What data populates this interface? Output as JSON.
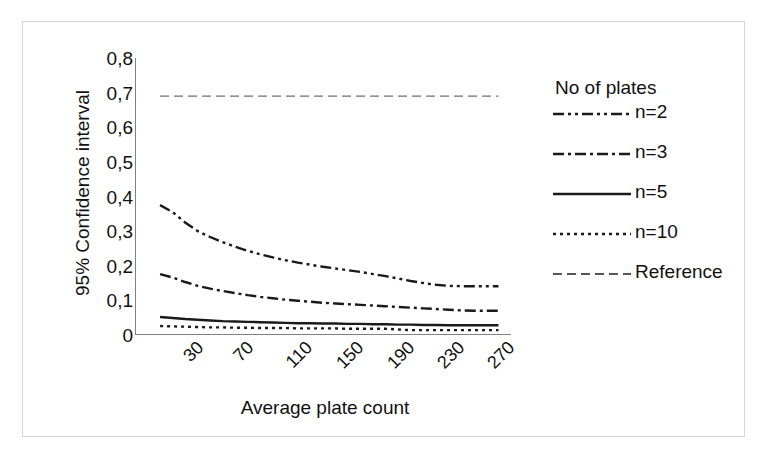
{
  "chart_data": {
    "type": "line",
    "title": "",
    "xlabel": "Average plate count",
    "ylabel": "95% Confidence interval",
    "xlim": [
      10,
      310
    ],
    "ylim": [
      0,
      0.8
    ],
    "grid": false,
    "legend_position": "right",
    "legend_title": "No of plates",
    "x_tick_labels": [
      "30",
      "70",
      "110",
      "150",
      "190",
      "230",
      "270"
    ],
    "x_tick_values": [
      30,
      70,
      110,
      150,
      190,
      230,
      270
    ],
    "y_tick_labels": [
      "0",
      "0,1",
      "0,2",
      "0,3",
      "0,4",
      "0,5",
      "0,6",
      "0,7",
      "0,8"
    ],
    "y_tick_values": [
      0,
      0.1,
      0.2,
      0.3,
      0.4,
      0.5,
      0.6,
      0.7,
      0.8
    ],
    "x": [
      30,
      40,
      50,
      60,
      70,
      80,
      90,
      100,
      110,
      120,
      130,
      140,
      150,
      160,
      170,
      180,
      190,
      200,
      210,
      220,
      230,
      240,
      250,
      260,
      270,
      280,
      290,
      300
    ],
    "series": [
      {
        "name": "n=2",
        "dash": "dash-dot-dot",
        "values": [
          0.375,
          0.355,
          0.325,
          0.3,
          0.283,
          0.268,
          0.255,
          0.243,
          0.233,
          0.224,
          0.216,
          0.209,
          0.203,
          0.197,
          0.192,
          0.187,
          0.182,
          0.176,
          0.17,
          0.163,
          0.156,
          0.15,
          0.145,
          0.142,
          0.141,
          0.141,
          0.141,
          0.141
        ]
      },
      {
        "name": "n=3",
        "dash": "dash-dot",
        "values": [
          0.176,
          0.166,
          0.153,
          0.142,
          0.134,
          0.127,
          0.121,
          0.115,
          0.11,
          0.106,
          0.102,
          0.099,
          0.096,
          0.093,
          0.091,
          0.089,
          0.087,
          0.085,
          0.083,
          0.081,
          0.079,
          0.077,
          0.075,
          0.073,
          0.071,
          0.07,
          0.07,
          0.07
        ]
      },
      {
        "name": "n=5",
        "dash": "solid",
        "values": [
          0.052,
          0.049,
          0.046,
          0.044,
          0.042,
          0.04,
          0.039,
          0.038,
          0.037,
          0.036,
          0.035,
          0.034,
          0.034,
          0.033,
          0.033,
          0.032,
          0.032,
          0.031,
          0.031,
          0.03,
          0.03,
          0.029,
          0.029,
          0.028,
          0.028,
          0.028,
          0.028,
          0.028
        ]
      },
      {
        "name": "n=10",
        "dash": "dotted",
        "values": [
          0.026,
          0.025,
          0.024,
          0.023,
          0.022,
          0.022,
          0.021,
          0.021,
          0.02,
          0.02,
          0.02,
          0.019,
          0.019,
          0.019,
          0.019,
          0.018,
          0.018,
          0.018,
          0.018,
          0.016,
          0.014,
          0.014,
          0.014,
          0.014,
          0.014,
          0.014,
          0.014,
          0.014
        ]
      },
      {
        "name": "Reference",
        "dash": "dashed",
        "constant": 0.69,
        "values": [
          0.69,
          0.69,
          0.69,
          0.69,
          0.69,
          0.69,
          0.69,
          0.69,
          0.69,
          0.69,
          0.69,
          0.69,
          0.69,
          0.69,
          0.69,
          0.69,
          0.69,
          0.69,
          0.69,
          0.69,
          0.69,
          0.69,
          0.69,
          0.69,
          0.69,
          0.69,
          0.69,
          0.69
        ]
      }
    ],
    "colors": {
      "line": "#1a1a1a",
      "reference_line": "#6f6f6f",
      "axis": "#808080",
      "frame": "#d6d6d6",
      "background": "#ffffff"
    }
  },
  "legend": {
    "title": "No of plates",
    "entries": [
      {
        "label": "n=2",
        "dash": "dash-dot-dot"
      },
      {
        "label": "n=3",
        "dash": "dash-dot"
      },
      {
        "label": "n=5",
        "dash": "solid"
      },
      {
        "label": "n=10",
        "dash": "dotted"
      },
      {
        "label": "Reference",
        "dash": "dashed"
      }
    ]
  }
}
